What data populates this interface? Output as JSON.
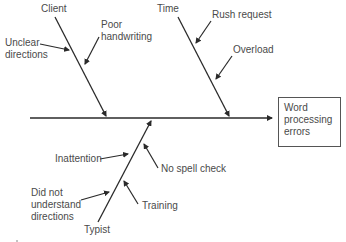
{
  "diagram": {
    "type": "fishbone",
    "effect": {
      "lines": [
        "Word",
        "processing",
        "errors"
      ]
    },
    "categories": [
      {
        "name": "Client",
        "causes": [
          "Unclear directions",
          "Poor handwriting"
        ]
      },
      {
        "name": "Time",
        "causes": [
          "Rush request",
          "Overload"
        ]
      },
      {
        "name": "Typist",
        "causes": [
          "Inattention",
          "Did not understand directions",
          "Training",
          "No spell check"
        ]
      }
    ],
    "labels": {
      "client": "Client",
      "unclear1": "Unclear",
      "unclear2": "directions",
      "poor1": "Poor",
      "poor2": "handwriting",
      "time": "Time",
      "rush": "Rush request",
      "overload": "Overload",
      "inattention": "Inattention",
      "nospell": "No spell check",
      "didnot1": "Did not",
      "didnot2": "understand",
      "didnot3": "directions",
      "training": "Training",
      "typist": "Typist"
    },
    "colors": {
      "line": "#2a2a2a",
      "text": "#4a4a4a"
    }
  }
}
